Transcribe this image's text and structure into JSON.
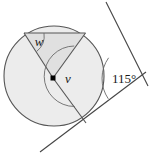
{
  "figure": {
    "name": "circle-tangent-angle-diagram",
    "type": "geometry-diagram",
    "background_color": "#ffffff",
    "stroke_color": "#4a4a4a",
    "fill_circle": "#ececec",
    "fill_sector": "#e2e2e2",
    "labels": {
      "angle_w": "w",
      "angle_v": "v",
      "angle_apex": "115°"
    },
    "circle": {
      "cx": 54,
      "cy": 76,
      "r": 50
    },
    "center_marker": {
      "cx": 53,
      "cy": 78,
      "size": 5,
      "shape": "square",
      "color": "#000000"
    },
    "points": {
      "chord_left": {
        "x": 24,
        "y": 33
      },
      "tangent_point_upper": {
        "x": 85.5,
        "y": 33
      },
      "tangent_point_lower": {
        "x": 86,
        "y": 123
      },
      "apex": {
        "x": 137,
        "y": 78
      }
    },
    "tangent_upper": {
      "x1": 106,
      "y1": 2,
      "x2": 148,
      "y2": 86
    },
    "tangent_lower": {
      "x1": 40,
      "y1": 152,
      "x2": 146,
      "y2": 72
    },
    "label_positions": {
      "w": {
        "x": 39,
        "y": 45
      },
      "v": {
        "x": 68,
        "y": 82
      },
      "deg": {
        "x": 113,
        "y": 82
      }
    }
  }
}
